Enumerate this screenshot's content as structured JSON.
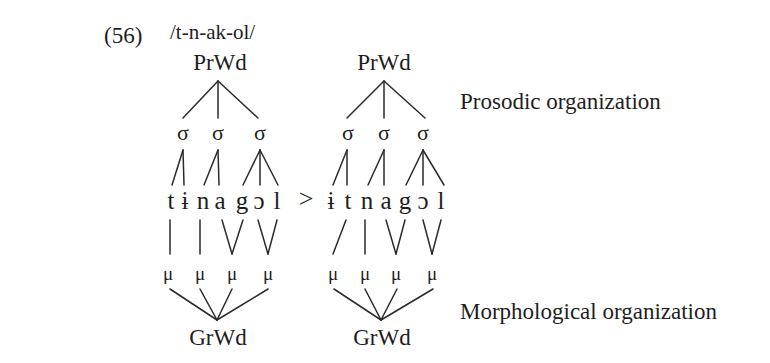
{
  "example": {
    "number": "(56)",
    "underlying_form": "/t-n-ak-ol/"
  },
  "labels": {
    "prosodic": "Prosodic organization",
    "morphological": "Morphological organization"
  },
  "arrow": ">",
  "trees": [
    {
      "name": "input",
      "prwd": "PrWd",
      "syllables": [
        "σ",
        "σ",
        "σ"
      ],
      "segments": [
        "t",
        "ɨ",
        "n",
        "a",
        "g",
        "ɔ",
        "l"
      ],
      "moras": [
        "μ",
        "μ",
        "μ",
        "μ"
      ],
      "grwd": "GrWd"
    },
    {
      "name": "output",
      "prwd": "PrWd",
      "syllables": [
        "σ",
        "σ",
        "σ"
      ],
      "segments": [
        "ɨ",
        "t",
        "n",
        "a",
        "g",
        "ɔ",
        "l"
      ],
      "moras": [
        "μ",
        "μ",
        "μ",
        "μ"
      ],
      "grwd": "GrWd"
    }
  ]
}
